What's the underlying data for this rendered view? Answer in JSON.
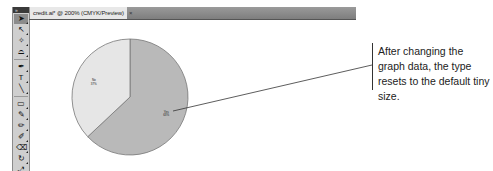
{
  "document_tab": {
    "title": "credit.ai* @ 200% (CMYK/Preview)",
    "close_glyph": "×"
  },
  "tool_panel": {
    "collapse_glyph": "»",
    "tools": [
      {
        "name": "selection-tool",
        "glyph": "➤",
        "active": true
      },
      {
        "name": "direct-selection-tool",
        "glyph": "↖",
        "active": false
      },
      {
        "name": "magic-wand-tool",
        "glyph": "✧",
        "active": false
      },
      {
        "name": "lasso-tool",
        "glyph": "⌓",
        "active": false
      },
      {
        "name": "pen-tool",
        "glyph": "✒",
        "active": false
      },
      {
        "name": "type-tool",
        "glyph": "T",
        "active": false
      },
      {
        "name": "line-segment-tool",
        "glyph": "╲",
        "active": false
      },
      {
        "name": "rectangle-tool",
        "glyph": "▭",
        "active": false
      },
      {
        "name": "paintbrush-tool",
        "glyph": "✎",
        "active": false
      },
      {
        "name": "pencil-tool",
        "glyph": "✏",
        "active": false
      },
      {
        "name": "blob-brush-tool",
        "glyph": "✐",
        "active": false
      },
      {
        "name": "eraser-tool",
        "glyph": "⌫",
        "active": false
      },
      {
        "name": "rotate-tool",
        "glyph": "↻",
        "active": false
      },
      {
        "name": "scale-tool",
        "glyph": "⤢",
        "active": false
      }
    ]
  },
  "chart_data": {
    "type": "pie",
    "title": "",
    "slices": [
      {
        "label": "Yes",
        "value": 63,
        "value_label": "63%",
        "color": "#b9b9b9"
      },
      {
        "label": "No",
        "value": 37,
        "value_label": "37%",
        "color": "#e6e6e6"
      }
    ],
    "start_angle_deg": 0,
    "direction": "clockwise",
    "legend": "none",
    "stroke_color": "#777777"
  },
  "callout": {
    "text": "After changing the graph data, the type resets to the default tiny size."
  }
}
